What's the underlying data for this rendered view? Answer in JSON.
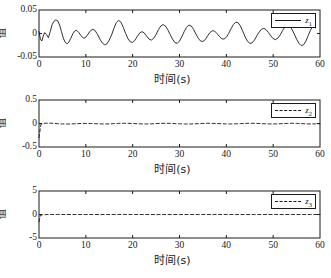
{
  "figure": {
    "background": "#ffffff",
    "line_color": "#1a1a1a",
    "width": 331,
    "height": 278
  },
  "chart_data": [
    {
      "type": "line",
      "title": "",
      "xlabel": "时间(s)",
      "ylabel": "值",
      "xlim": [
        0,
        60
      ],
      "ylim": [
        -0.05,
        0.05
      ],
      "xticks": [
        0,
        10,
        20,
        30,
        40,
        50,
        60
      ],
      "xtick_labels": [
        "0",
        "10",
        "20",
        "30",
        "40",
        "50",
        "60"
      ],
      "yticks": [
        -0.05,
        0,
        0.05
      ],
      "ytick_labels": [
        "-0.05",
        "0",
        "0.05"
      ],
      "grid": false,
      "legend": {
        "position": "upper right",
        "entries": [
          {
            "label": "z",
            "subscript": "1",
            "style": "solid"
          }
        ]
      },
      "series": [
        {
          "name": "z1",
          "style": "solid",
          "x": [
            0,
            0.3,
            0.6,
            0.9,
            1.2,
            1.6,
            2.0,
            2.4,
            2.8,
            3.2,
            3.6,
            4.0,
            4.4,
            4.8,
            5.2,
            5.6,
            6.0,
            6.4,
            6.8,
            7.2,
            7.6,
            8.0,
            8.5,
            9.0,
            9.5,
            10.0,
            10.5,
            11.0,
            11.5,
            12.0,
            12.5,
            13.0,
            13.5,
            14.0,
            14.5,
            15.0,
            15.5,
            16.0,
            16.5,
            17.0,
            17.5,
            18.0,
            18.5,
            19.0,
            19.5,
            20.0,
            20.5,
            21.0,
            21.5,
            22.0,
            22.5,
            23.0,
            23.5,
            24.0,
            24.5,
            25.0,
            25.5,
            26.0,
            26.5,
            27.0,
            27.5,
            28.0,
            28.5,
            29.0,
            29.5,
            30.0,
            30.5,
            31.0,
            31.5,
            32.0,
            32.5,
            33.0,
            33.5,
            34.0,
            34.5,
            35.0,
            35.5,
            36.0,
            36.5,
            37.0,
            37.5,
            38.0,
            38.5,
            39.0,
            39.5,
            40.0,
            40.5,
            41.0,
            41.5,
            42.0,
            42.5,
            43.0,
            43.5,
            44.0,
            44.5,
            45.0,
            45.5,
            46.0,
            46.5,
            47.0,
            47.5,
            48.0,
            48.5,
            49.0,
            49.5,
            50.0,
            50.5,
            51.0,
            51.5,
            52.0,
            52.5,
            53.0,
            53.5,
            54.0,
            54.5,
            55.0,
            55.5,
            56.0,
            56.5,
            57.0,
            57.5,
            58.0,
            58.5,
            59.0,
            59.5,
            60.0
          ],
          "y": [
            0.004,
            -0.012,
            -0.016,
            -0.006,
            0.002,
            -0.002,
            -0.009,
            0.004,
            0.019,
            0.026,
            0.029,
            0.027,
            0.018,
            0.004,
            -0.01,
            -0.019,
            -0.022,
            -0.018,
            -0.01,
            -0.001,
            0.005,
            0.007,
            0.002,
            -0.005,
            -0.01,
            -0.008,
            -0.001,
            0.006,
            0.009,
            0.006,
            -0.002,
            -0.012,
            -0.02,
            -0.024,
            -0.022,
            -0.014,
            -0.003,
            0.011,
            0.023,
            0.028,
            0.024,
            0.013,
            0.0,
            -0.011,
            -0.018,
            -0.019,
            -0.014,
            -0.006,
            0.001,
            0.004,
            0.001,
            -0.006,
            -0.012,
            -0.014,
            -0.01,
            -0.002,
            0.008,
            0.016,
            0.019,
            0.016,
            0.008,
            -0.002,
            -0.012,
            -0.019,
            -0.021,
            -0.016,
            -0.007,
            0.004,
            0.013,
            0.018,
            0.016,
            0.009,
            -0.001,
            -0.01,
            -0.016,
            -0.017,
            -0.013,
            -0.005,
            0.002,
            0.006,
            0.005,
            0.0,
            -0.006,
            -0.011,
            -0.012,
            -0.008,
            0.0,
            0.01,
            0.019,
            0.024,
            0.023,
            0.016,
            0.005,
            -0.007,
            -0.016,
            -0.021,
            -0.02,
            -0.014,
            -0.005,
            0.003,
            0.009,
            0.011,
            0.008,
            0.002,
            -0.005,
            -0.011,
            -0.013,
            -0.01,
            -0.003,
            0.006,
            0.014,
            0.018,
            0.016,
            0.009,
            -0.001,
            -0.012,
            -0.021,
            -0.026,
            -0.024,
            -0.016,
            -0.004,
            0.008,
            0.015,
            0.012
          ]
        }
      ]
    },
    {
      "type": "line",
      "title": "",
      "xlabel": "时间(s)",
      "ylabel": "值",
      "xlim": [
        0,
        60
      ],
      "ylim": [
        -0.5,
        0.5
      ],
      "xticks": [
        0,
        10,
        20,
        30,
        40,
        50,
        60
      ],
      "xtick_labels": [
        "0",
        "10",
        "20",
        "30",
        "40",
        "50",
        "60"
      ],
      "yticks": [
        -0.5,
        0,
        0.5
      ],
      "ytick_labels": [
        "-0.5",
        "0",
        "0.5"
      ],
      "grid": false,
      "legend": {
        "position": "upper right",
        "entries": [
          {
            "label": "z",
            "subscript": "2",
            "style": "dashed"
          }
        ]
      },
      "series": [
        {
          "name": "z2",
          "style": "dashed",
          "x": [
            0,
            0.4,
            1.0,
            2.0,
            3.0,
            4.0,
            5.0,
            6.0,
            7.0,
            8.0,
            9.0,
            10.0,
            11.0,
            12.0,
            13.0,
            14.0,
            15.0,
            16.0,
            17.0,
            18.0,
            19.0,
            20.0,
            21.0,
            22.0,
            23.0,
            24.0,
            25.0,
            26.0,
            27.0,
            28.0,
            29.0,
            30.0,
            31.0,
            32.0,
            33.0,
            34.0,
            35.0,
            36.0,
            37.0,
            38.0,
            39.0,
            40.0,
            41.0,
            42.0,
            43.0,
            44.0,
            45.0,
            46.0,
            47.0,
            48.0,
            49.0,
            50.0,
            51.0,
            52.0,
            53.0,
            54.0,
            55.0,
            56.0,
            57.0,
            58.0,
            59.0,
            60.0
          ],
          "y": [
            -0.3,
            -0.02,
            0.005,
            0.008,
            0.004,
            -0.004,
            -0.01,
            -0.012,
            -0.009,
            -0.004,
            0.0,
            0.002,
            0.0,
            -0.004,
            -0.008,
            -0.01,
            -0.008,
            -0.003,
            0.002,
            0.005,
            0.004,
            0.0,
            -0.005,
            -0.009,
            -0.01,
            -0.007,
            -0.002,
            0.002,
            0.004,
            0.003,
            -0.001,
            -0.006,
            -0.01,
            -0.011,
            -0.008,
            -0.003,
            0.001,
            0.004,
            0.003,
            -0.001,
            -0.005,
            -0.009,
            -0.01,
            -0.007,
            -0.002,
            0.002,
            0.005,
            0.004,
            0.0,
            -0.005,
            -0.009,
            -0.01,
            -0.007,
            -0.002,
            0.002,
            0.005,
            0.003,
            -0.002,
            -0.007,
            -0.01,
            -0.008,
            -0.003
          ]
        }
      ]
    },
    {
      "type": "line",
      "title": "",
      "xlabel": "时间(s)",
      "ylabel": "值",
      "xlim": [
        0,
        60
      ],
      "ylim": [
        -5,
        5
      ],
      "xticks": [
        0,
        10,
        20,
        30,
        40,
        50,
        60
      ],
      "xtick_labels": [
        "0",
        "10",
        "20",
        "30",
        "40",
        "50",
        "60"
      ],
      "yticks": [
        -5,
        0,
        5
      ],
      "ytick_labels": [
        "-5",
        "0",
        "5"
      ],
      "grid": false,
      "legend": {
        "position": "upper right",
        "entries": [
          {
            "label": "z",
            "subscript": "3",
            "style": "dashed"
          }
        ]
      },
      "series": [
        {
          "name": "z3",
          "style": "dashed",
          "x": [
            0,
            0.3,
            0.8,
            2.0,
            4.0,
            6.0,
            8.0,
            10.0,
            14.0,
            18.0,
            22.0,
            26.0,
            30.0,
            34.0,
            38.0,
            42.0,
            46.0,
            50.0,
            54.0,
            58.0,
            60.0
          ],
          "y": [
            -1.55,
            -0.18,
            -0.04,
            0.0,
            0.01,
            0.0,
            -0.01,
            0.0,
            0.0,
            0.01,
            0.0,
            -0.01,
            0.0,
            0.0,
            0.01,
            0.0,
            -0.01,
            0.0,
            0.0,
            0.0,
            -0.01
          ]
        }
      ]
    }
  ]
}
